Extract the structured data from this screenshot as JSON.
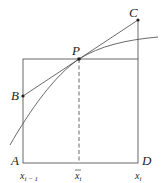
{
  "diagram": {
    "type": "geometry-figure",
    "points": {
      "A": {
        "label": "A"
      },
      "B": {
        "label": "B"
      },
      "C": {
        "label": "C"
      },
      "D": {
        "label": "D"
      },
      "P": {
        "label": "P"
      }
    },
    "axis_labels": {
      "left": {
        "base": "x",
        "sub": "i − 1"
      },
      "mid": {
        "base": "x",
        "sub": "i",
        "overbar": true
      },
      "right": {
        "base": "x",
        "sub": "i"
      }
    },
    "colors": {
      "line": "#58595b",
      "text": "#231f20",
      "point": "#231f20"
    }
  }
}
